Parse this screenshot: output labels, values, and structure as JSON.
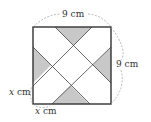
{
  "diagram": {
    "type": "geometry-square-with-shaded-triangles",
    "square": {
      "x": 33,
      "y": 27,
      "size": 78,
      "stroke": "#333333"
    },
    "shade_color": "#c8c8c8",
    "line_color": "#444444",
    "dimension_color": "#888888",
    "labels": {
      "top": "9 cm",
      "right": "9 cm",
      "left_var": "x",
      "left_unit": " cm",
      "bottom_var": "x",
      "bottom_unit": " cm"
    }
  }
}
